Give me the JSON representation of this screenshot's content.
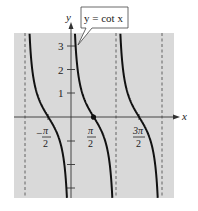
{
  "figure": {
    "function_label": "y = cot x",
    "x_axis_label": "x",
    "y_axis_label": "y",
    "background_color": "#d9d9d9",
    "curve_color": "#111111",
    "y_ticks": [
      "1",
      "2",
      "3"
    ],
    "x_ticks": [
      {
        "num": "π",
        "den": "2",
        "sign": "−"
      },
      {
        "num": "π",
        "den": "2",
        "sign": ""
      },
      {
        "num": "3π",
        "den": "2",
        "sign": ""
      }
    ],
    "asymptotes": [
      "-π",
      "0",
      "π",
      "2π"
    ],
    "marked_point": "(π/2, 0)"
  }
}
